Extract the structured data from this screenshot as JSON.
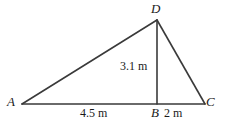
{
  "figure": {
    "type": "geometry-diagram",
    "shape": "triangle-with-altitude",
    "stroke_color": "#3a3a3a",
    "background_color": "#ffffff",
    "width": 226,
    "height": 127
  },
  "vertices": {
    "A": {
      "label": "A",
      "x": 22,
      "y": 104
    },
    "B": {
      "label": "B",
      "x": 157,
      "y": 104
    },
    "C": {
      "label": "C",
      "x": 205,
      "y": 104
    },
    "D": {
      "label": "D",
      "x": 157,
      "y": 20
    }
  },
  "segments": [
    {
      "name": "AD",
      "from": "A",
      "to": "D"
    },
    {
      "name": "DC",
      "from": "D",
      "to": "C"
    },
    {
      "name": "AC",
      "from": "A",
      "to": "C"
    },
    {
      "name": "DB",
      "from": "D",
      "to": "B"
    }
  ],
  "measurements": {
    "height_DB": "3.1 m",
    "base_AB": "4.5 m",
    "base_BC": "2 m"
  }
}
